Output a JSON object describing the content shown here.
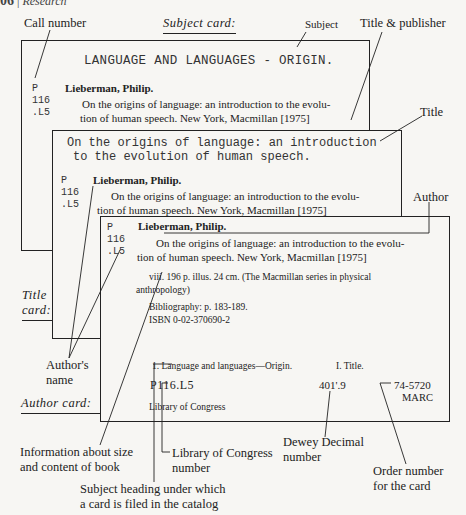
{
  "page_header": {
    "page_number": "06",
    "section": "Research"
  },
  "annotations": {
    "call_number": "Call number",
    "subject_card": "Subject card:",
    "subject": "Subject",
    "title_publisher": "Title & publisher",
    "title": "Title",
    "author": "Author",
    "title_card_line1": "Title",
    "title_card_line2": "card:",
    "authors_name_line1": "Author's",
    "authors_name_line2": "name",
    "author_card": "Author card:",
    "info_size_line1": "Information about size",
    "info_size_line2": "and content of book",
    "loc_number_line1": "Library of Congress",
    "loc_number_line2": "number",
    "dewey_line1": "Dewey Decimal",
    "dewey_line2": "number",
    "order_line1": "Order number",
    "order_line2": "for the card",
    "subject_heading_line1": "Subject heading under which",
    "subject_heading_line2": "a card is filed in the catalog"
  },
  "subject_card": {
    "heading": "LANGUAGE AND LANGUAGES - ORIGIN.",
    "call_number": [
      "P",
      "116",
      ".L5"
    ],
    "author": "Lieberman, Philip.",
    "title_line1": "On the origins of language:  an introduction to the evolu-",
    "title_line2": "tion of human speech.  New York, Macmillan [1975]"
  },
  "title_card": {
    "heading_line1": "On the origins of language: an introduction",
    "heading_line2": "to the evolution of human speech.",
    "call_number": [
      "P",
      "116",
      ".L5"
    ],
    "author": "Lieberman, Philip.",
    "title_line1": "On the origins of language:  an introduction to the evolu-",
    "title_line2": "tion of human speech.  New York, Macmillan [1975]"
  },
  "author_card": {
    "call_number": [
      "P",
      "116",
      ".L5"
    ],
    "author": "Lieberman, Philip.",
    "title_line1": "On the origins of language:  an introduction to the evolu-",
    "title_line2": "tion of human speech.  New York, Macmillan [1975]",
    "collation_line1": "viii. 196 p.  illus.  24 cm.  (The Macmillan series in physical",
    "collation_line2": "anthropology)",
    "bibliography": "Bibliography:  p. 183-189.",
    "isbn": "ISBN 0-02-370690-2",
    "tracings": "1.  Language and languages—Origin.",
    "tracings_title": "I.  Title.",
    "lc_number": "P116.L5",
    "dewey": "401'.9",
    "order_number": "74-5720",
    "marc": "MARC",
    "library": "Library of Congress"
  }
}
